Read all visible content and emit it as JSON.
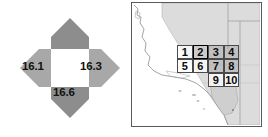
{
  "figure": {
    "panels": [
      "compass-rose",
      "california-grid-map"
    ]
  },
  "compass": {
    "name": "direction-value-rose",
    "north": {
      "label": "",
      "shade": "#8d8d8d",
      "has_value": false
    },
    "south": {
      "label": "16.6",
      "shade": "#8d8d8d",
      "has_value": true
    },
    "west": {
      "label": "16.1",
      "shade": "#a8a8a8",
      "has_value": true
    },
    "east": {
      "label": "16.3",
      "shade": "#a8a8a8",
      "has_value": true
    },
    "center": {
      "label": "",
      "fill": "#ffffff"
    }
  },
  "map": {
    "title": "",
    "region": "California",
    "frame_color": "#5a5a5a",
    "land_fill": "#d7d7d7",
    "ocean_fill": "#ffffff",
    "selected_cell": "2",
    "grid_cells": [
      {
        "id": "1",
        "label": "1",
        "row": 0,
        "col": 0,
        "style": "plain"
      },
      {
        "id": "2",
        "label": "2",
        "row": 0,
        "col": 1,
        "style": "selected"
      },
      {
        "id": "3",
        "label": "3",
        "row": 0,
        "col": 2,
        "style": "shaded"
      },
      {
        "id": "4",
        "label": "4",
        "row": 0,
        "col": 3,
        "style": "shaded"
      },
      {
        "id": "5",
        "label": "5",
        "row": 1,
        "col": 0,
        "style": "plain"
      },
      {
        "id": "6",
        "label": "6",
        "row": 1,
        "col": 1,
        "style": "plain"
      },
      {
        "id": "7",
        "label": "7",
        "row": 1,
        "col": 2,
        "style": "shaded"
      },
      {
        "id": "8",
        "label": "8",
        "row": 1,
        "col": 3,
        "style": "shaded"
      },
      {
        "id": "9",
        "label": "9",
        "row": 2,
        "col": 2,
        "style": "plain"
      },
      {
        "id": "10",
        "label": "10",
        "row": 2,
        "col": 3,
        "style": "plain"
      }
    ]
  },
  "chart_data": {
    "type": "diagram",
    "title": "",
    "categories": [
      "north",
      "east",
      "south",
      "west"
    ],
    "values": [
      null,
      16.3,
      16.6,
      16.1
    ],
    "value_labels": [
      "",
      "16.3",
      "16.6",
      "16.1"
    ],
    "grid_labels": [
      "1",
      "2",
      "3",
      "4",
      "5",
      "6",
      "7",
      "8",
      "9",
      "10"
    ],
    "highlighted": "2",
    "legend": [],
    "grid": false
  }
}
